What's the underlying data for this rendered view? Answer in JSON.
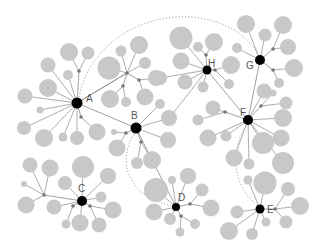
{
  "diagram": {
    "type": "network",
    "colors": {
      "background": "#ffffff",
      "hub": "#000000",
      "leaf": "#c8c8c8",
      "intermediate": "#777777",
      "edge": "#8a8a8a",
      "dotted_edge": "#9a9a9a",
      "label": "#555555"
    },
    "hubs": [
      {
        "id": "A",
        "label": "A",
        "x": 77,
        "y": 103,
        "r": 5.5,
        "lx": 86,
        "ly": 102
      },
      {
        "id": "B",
        "label": "B",
        "x": 136,
        "y": 128,
        "r": 5.5,
        "lx": 131,
        "ly": 119
      },
      {
        "id": "C",
        "label": "C",
        "x": 82,
        "y": 201,
        "r": 5,
        "lx": 78,
        "ly": 192
      },
      {
        "id": "D",
        "label": "D",
        "x": 176,
        "y": 207,
        "r": 4,
        "lx": 178,
        "ly": 201
      },
      {
        "id": "E",
        "label": "E",
        "x": 260,
        "y": 209,
        "r": 4.5,
        "lx": 267,
        "ly": 213
      },
      {
        "id": "F",
        "label": "F",
        "x": 248,
        "y": 120,
        "r": 5,
        "lx": 240,
        "ly": 116
      },
      {
        "id": "G",
        "label": "G",
        "x": 260,
        "y": 60,
        "r": 5,
        "lx": 246,
        "ly": 69
      },
      {
        "id": "H",
        "label": "H",
        "x": 207,
        "y": 70,
        "r": 4.5,
        "lx": 208,
        "ly": 67
      }
    ],
    "intermediates": [
      {
        "id": "iA1",
        "x": 79,
        "y": 71,
        "parent": "A"
      },
      {
        "id": "iA2",
        "x": 81,
        "y": 117,
        "parent": "A"
      },
      {
        "id": "iAB",
        "x": 127,
        "y": 73,
        "parent": "A"
      },
      {
        "id": "iAB2",
        "x": 123,
        "y": 86,
        "parent": "iAB"
      },
      {
        "id": "iAB3",
        "x": 139,
        "y": 80,
        "parent": "iAB"
      },
      {
        "id": "iB1",
        "x": 126,
        "y": 133,
        "parent": "B"
      },
      {
        "id": "iB2",
        "x": 141,
        "y": 142,
        "parent": "B"
      },
      {
        "id": "iC1",
        "x": 44,
        "y": 195,
        "parent": "C"
      },
      {
        "id": "iC2",
        "x": 73,
        "y": 206,
        "parent": "C"
      },
      {
        "id": "iC3",
        "x": 90,
        "y": 206,
        "parent": "C"
      },
      {
        "id": "iD1",
        "x": 190,
        "y": 204,
        "parent": "D"
      },
      {
        "id": "iD2",
        "x": 181,
        "y": 216,
        "parent": "D"
      },
      {
        "id": "iE1",
        "x": 275,
        "y": 209,
        "parent": "E"
      },
      {
        "id": "iF1",
        "x": 225,
        "y": 112,
        "parent": "F"
      },
      {
        "id": "iF2",
        "x": 261,
        "y": 106,
        "parent": "F"
      },
      {
        "id": "iG1",
        "x": 273,
        "y": 49,
        "parent": "G"
      },
      {
        "id": "iG2",
        "x": 273,
        "y": 70,
        "parent": "G"
      },
      {
        "id": "iH1",
        "x": 206,
        "y": 55,
        "parent": "H"
      },
      {
        "id": "iH2",
        "x": 215,
        "y": 70,
        "parent": "H"
      }
    ],
    "leaves": [
      {
        "x": 69,
        "y": 52,
        "r": 9,
        "parent": "iA1"
      },
      {
        "x": 88,
        "y": 53,
        "r": 6.5,
        "parent": "iA1"
      },
      {
        "x": 48,
        "y": 65,
        "r": 7.5,
        "parent": "A"
      },
      {
        "x": 68,
        "y": 75,
        "r": 5,
        "parent": "A"
      },
      {
        "x": 48,
        "y": 88,
        "r": 9,
        "parent": "A"
      },
      {
        "x": 25,
        "y": 96,
        "r": 7.5,
        "parent": "A"
      },
      {
        "x": 40,
        "y": 110,
        "r": 3.5,
        "parent": "A"
      },
      {
        "x": 24,
        "y": 128,
        "r": 7,
        "parent": "A"
      },
      {
        "x": 44,
        "y": 138,
        "r": 9,
        "parent": "A"
      },
      {
        "x": 63,
        "y": 137,
        "r": 4.5,
        "parent": "A"
      },
      {
        "x": 77,
        "y": 138,
        "r": 7,
        "parent": "A"
      },
      {
        "x": 97,
        "y": 132,
        "r": 8.5,
        "parent": "iA2"
      },
      {
        "x": 109,
        "y": 68,
        "r": 11.5,
        "parent": "iAB"
      },
      {
        "x": 121,
        "y": 51,
        "r": 5.5,
        "parent": "iAB"
      },
      {
        "x": 139,
        "y": 45,
        "r": 9,
        "parent": "iAB"
      },
      {
        "x": 145,
        "y": 63,
        "r": 6,
        "parent": "iAB"
      },
      {
        "x": 110,
        "y": 99,
        "r": 9,
        "parent": "iAB2"
      },
      {
        "x": 126,
        "y": 102,
        "r": 5,
        "parent": "iAB2"
      },
      {
        "x": 145,
        "y": 97,
        "r": 8.5,
        "parent": "iAB3"
      },
      {
        "x": 156,
        "y": 78,
        "r": 8,
        "parent": "iAB3"
      },
      {
        "x": 160,
        "y": 104,
        "r": 5,
        "parent": "B"
      },
      {
        "x": 169,
        "y": 118,
        "r": 8,
        "parent": "B"
      },
      {
        "x": 168,
        "y": 140,
        "r": 8,
        "parent": "B"
      },
      {
        "x": 114,
        "y": 132,
        "r": 3,
        "parent": "iB1"
      },
      {
        "x": 117,
        "y": 148,
        "r": 8.5,
        "parent": "iB1"
      },
      {
        "x": 137,
        "y": 163,
        "r": 6,
        "parent": "iB2"
      },
      {
        "x": 152,
        "y": 160,
        "r": 9,
        "parent": "iB2"
      },
      {
        "x": 30,
        "y": 165,
        "r": 7.5,
        "parent": "iC1"
      },
      {
        "x": 50,
        "y": 168,
        "r": 8.5,
        "parent": "iC1"
      },
      {
        "x": 24,
        "y": 184,
        "r": 3,
        "parent": "iC1"
      },
      {
        "x": 26,
        "y": 205,
        "r": 8.5,
        "parent": "iC1"
      },
      {
        "x": 54,
        "y": 207,
        "r": 7.5,
        "parent": "C"
      },
      {
        "x": 83,
        "y": 167,
        "r": 11,
        "parent": "C"
      },
      {
        "x": 65,
        "y": 183,
        "r": 7,
        "parent": "C"
      },
      {
        "x": 108,
        "y": 176,
        "r": 8,
        "parent": "C"
      },
      {
        "x": 101,
        "y": 197,
        "r": 5.5,
        "parent": "C"
      },
      {
        "x": 113,
        "y": 210,
        "r": 8.5,
        "parent": "iC3"
      },
      {
        "x": 66,
        "y": 224,
        "r": 4.5,
        "parent": "iC2"
      },
      {
        "x": 80,
        "y": 223,
        "r": 8.5,
        "parent": "C"
      },
      {
        "x": 99,
        "y": 225,
        "r": 7.5,
        "parent": "iC3"
      },
      {
        "x": 156,
        "y": 190,
        "r": 12,
        "parent": "D"
      },
      {
        "x": 172,
        "y": 180,
        "r": 4,
        "parent": "D"
      },
      {
        "x": 188,
        "y": 176,
        "r": 8,
        "parent": "D"
      },
      {
        "x": 202,
        "y": 190,
        "r": 6.5,
        "parent": "iD1"
      },
      {
        "x": 211,
        "y": 208,
        "r": 8.5,
        "parent": "iD1"
      },
      {
        "x": 154,
        "y": 212,
        "r": 8.5,
        "parent": "D"
      },
      {
        "x": 170,
        "y": 219,
        "r": 6,
        "parent": "D"
      },
      {
        "x": 195,
        "y": 224,
        "r": 5,
        "parent": "iD2"
      },
      {
        "x": 180,
        "y": 232,
        "r": 4.5,
        "parent": "iD2"
      },
      {
        "x": 208,
        "y": 138,
        "r": 8.5,
        "parent": "F"
      },
      {
        "x": 226,
        "y": 136,
        "r": 5.5,
        "parent": "F"
      },
      {
        "x": 263,
        "y": 143,
        "r": 11,
        "parent": "F"
      },
      {
        "x": 234,
        "y": 158,
        "r": 8.5,
        "parent": "F"
      },
      {
        "x": 249,
        "y": 164,
        "r": 5.5,
        "parent": "F"
      },
      {
        "x": 237,
        "y": 212,
        "r": 6.5,
        "parent": "E"
      },
      {
        "x": 265,
        "y": 183,
        "r": 11.5,
        "parent": "E"
      },
      {
        "x": 248,
        "y": 180,
        "r": 4.5,
        "parent": "E"
      },
      {
        "x": 288,
        "y": 189,
        "r": 7,
        "parent": "iE1"
      },
      {
        "x": 300,
        "y": 206,
        "r": 9,
        "parent": "iE1"
      },
      {
        "x": 286,
        "y": 222,
        "r": 6.5,
        "parent": "iE1"
      },
      {
        "x": 229,
        "y": 231,
        "r": 9,
        "parent": "E"
      },
      {
        "x": 252,
        "y": 234,
        "r": 6,
        "parent": "E"
      },
      {
        "x": 266,
        "y": 222,
        "r": 4.5,
        "parent": "E"
      },
      {
        "x": 213,
        "y": 108,
        "r": 7.5,
        "parent": "iF1"
      },
      {
        "x": 198,
        "y": 120,
        "r": 5.5,
        "parent": "iF1"
      },
      {
        "x": 264,
        "y": 91,
        "r": 7.5,
        "parent": "F"
      },
      {
        "x": 273,
        "y": 93,
        "r": 3.5,
        "parent": "iF2"
      },
      {
        "x": 286,
        "y": 103,
        "r": 6.5,
        "parent": "iF2"
      },
      {
        "x": 283,
        "y": 118,
        "r": 9,
        "parent": "F"
      },
      {
        "x": 281,
        "y": 138,
        "r": 8.5,
        "parent": "F"
      },
      {
        "x": 283,
        "y": 163,
        "r": 11,
        "parent": "F"
      },
      {
        "x": 246,
        "y": 24,
        "r": 9,
        "parent": "G"
      },
      {
        "x": 265,
        "y": 35,
        "r": 6.5,
        "parent": "G"
      },
      {
        "x": 283,
        "y": 25,
        "r": 9,
        "parent": "iG1"
      },
      {
        "x": 288,
        "y": 47,
        "r": 8,
        "parent": "iG1"
      },
      {
        "x": 237,
        "y": 48,
        "r": 5,
        "parent": "G"
      },
      {
        "x": 294,
        "y": 68,
        "r": 9,
        "parent": "iG2"
      },
      {
        "x": 279,
        "y": 83,
        "r": 5,
        "parent": "iG2"
      },
      {
        "x": 181,
        "y": 38,
        "r": 11.5,
        "parent": "H"
      },
      {
        "x": 198,
        "y": 47,
        "r": 5,
        "parent": "iH1"
      },
      {
        "x": 214,
        "y": 42,
        "r": 9,
        "parent": "iH1"
      },
      {
        "x": 181,
        "y": 61,
        "r": 8.5,
        "parent": "H"
      },
      {
        "x": 185,
        "y": 82,
        "r": 7.5,
        "parent": "H"
      },
      {
        "x": 203,
        "y": 87,
        "r": 5.5,
        "parent": "H"
      },
      {
        "x": 231,
        "y": 65,
        "r": 9,
        "parent": "iH2"
      },
      {
        "x": 229,
        "y": 84,
        "r": 5,
        "parent": "iH2"
      },
      {
        "x": 160,
        "y": 78,
        "r": 7,
        "parent": "H"
      },
      {
        "x": 170,
        "y": 117,
        "r": 6,
        "parent": "H"
      }
    ],
    "solid_edges": [
      [
        "A",
        "B"
      ],
      [
        "A",
        "iAB"
      ],
      [
        "B",
        "D"
      ],
      [
        "H",
        "F"
      ],
      [
        "G",
        "F"
      ]
    ],
    "dotted_arcs": [
      {
        "from": "A",
        "to": "G",
        "path": "M79,97 C90,40 150,10 200,18 C235,24 252,42 258,55"
      },
      {
        "from": "B",
        "to": "D",
        "path": "M134,134 C118,160 125,195 172,206"
      },
      {
        "from": "F",
        "to": "E",
        "path": "M246,126 C230,150 232,185 257,205"
      }
    ]
  }
}
